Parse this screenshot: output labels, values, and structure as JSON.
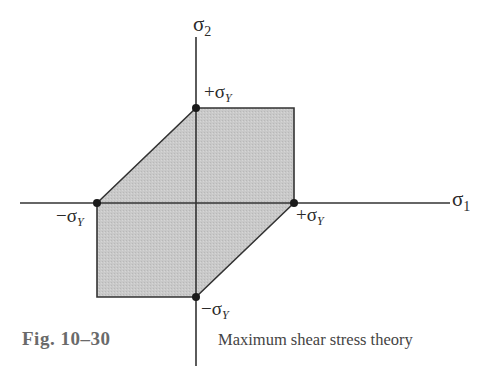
{
  "figure": {
    "number": "Fig. 10–30",
    "caption": "Maximum shear stress theory"
  },
  "colors": {
    "fill": "#c9c9c9",
    "line": "#333333",
    "point": "#1a1a1a",
    "figure_number": "#6a6a6a",
    "caption": "#444444"
  },
  "axes": {
    "x_label": "σ",
    "x_label_sub": "1",
    "y_label": "σ",
    "y_label_sub": "2"
  },
  "points": {
    "top": {
      "sign": "+",
      "symbol": "σ",
      "sub": "Y"
    },
    "right": {
      "sign": "+",
      "symbol": "σ",
      "sub": "Y"
    },
    "left": {
      "sign": "−",
      "symbol": "σ",
      "sub": "Y"
    },
    "bottom": {
      "sign": "−",
      "symbol": "σ",
      "sub": "Y"
    }
  },
  "region": {
    "description": "Hexagonal yield region (Tresca)",
    "vertices_sigma_Y_units": [
      [
        0,
        1
      ],
      [
        1,
        1
      ],
      [
        1,
        0
      ],
      [
        0,
        -1
      ],
      [
        -1,
        -1
      ],
      [
        -1,
        0
      ]
    ]
  }
}
